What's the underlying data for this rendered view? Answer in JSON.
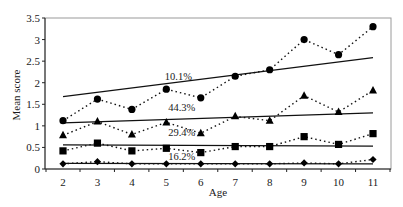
{
  "chart_data": {
    "type": "line",
    "title": "",
    "xlabel": "Age",
    "ylabel": "Mean score",
    "x": [
      2,
      3,
      4,
      5,
      6,
      7,
      8,
      9,
      10,
      11
    ],
    "xlim": [
      1.5,
      11.55
    ],
    "ylim": [
      0,
      3.5
    ],
    "yticks": [
      "0",
      "0.5",
      "1",
      "1.5",
      "2",
      "2.5",
      "3",
      "3.5"
    ],
    "xticks": [
      "2",
      "3",
      "4",
      "5",
      "6",
      "7",
      "8",
      "9",
      "10",
      "11"
    ],
    "grid": false,
    "legend": "none",
    "series": [
      {
        "name": "circle series",
        "marker": "circle",
        "values": [
          1.12,
          1.62,
          1.38,
          1.85,
          1.65,
          2.15,
          2.3,
          3.0,
          2.65,
          3.3
        ],
        "trend": [
          1.68,
          2.58
        ],
        "annotation": "10.1%",
        "annotation_pos": [
          5.1,
          2.15
        ]
      },
      {
        "name": "triangle series",
        "marker": "triangle",
        "values": [
          0.78,
          1.1,
          0.8,
          1.08,
          0.83,
          1.22,
          1.12,
          1.7,
          1.32,
          1.82
        ],
        "trend": [
          1.07,
          1.3
        ],
        "annotation": "44.3%",
        "annotation_pos": [
          5.2,
          1.43
        ]
      },
      {
        "name": "square series",
        "marker": "square",
        "values": [
          0.42,
          0.6,
          0.42,
          0.48,
          0.38,
          0.52,
          0.52,
          0.75,
          0.57,
          0.82
        ],
        "trend": [
          0.56,
          0.53
        ],
        "annotation": "29.4%",
        "annotation_pos": [
          5.2,
          0.86
        ]
      },
      {
        "name": "diamond series",
        "marker": "diamond",
        "values": [
          0.12,
          0.17,
          0.12,
          0.12,
          0.12,
          0.12,
          0.12,
          0.14,
          0.12,
          0.22
        ],
        "trend": [
          0.13,
          0.12
        ],
        "annotation": "16.2%",
        "annotation_pos": [
          5.2,
          0.29
        ]
      }
    ]
  },
  "labels": {
    "xlabel": "Age",
    "ylabel": "Mean score"
  }
}
